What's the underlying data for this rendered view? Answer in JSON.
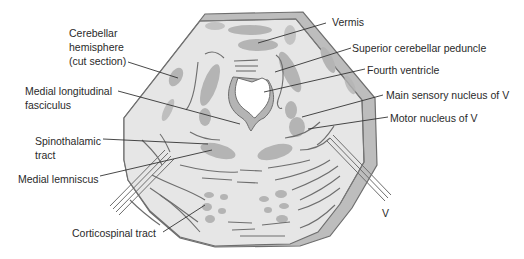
{
  "figure": {
    "colors": {
      "background": "#ffffff",
      "section_fill": "#e6e6e6",
      "rim_fill": "#bdbdbd",
      "outline": "#6e6e6e",
      "nucleus_fill": "#b4b4b4",
      "ventricle_fill": "#ffffff",
      "leader_line": "#333333",
      "label_text": "#2a2a2a"
    }
  },
  "labels": {
    "cerebellar_hemisphere": "Cerebellar\nhemisphere\n(cut section)",
    "medial_longitudinal_fasciculus": "Medial longitudinal\nfasciculus",
    "spinothalamic_tract": "Spinothalamic\ntract",
    "medial_lemniscus": "Medial lemniscus",
    "corticospinal_tract": "Corticospinal tract",
    "vermis": "Vermis",
    "superior_cerebellar_peduncle": "Superior cerebellar peduncle",
    "fourth_ventricle": "Fourth ventricle",
    "main_sensory_nucleus": "Main sensory nucleus of V",
    "motor_nucleus": "Motor nucleus of V",
    "trigeminal_nerve": "V"
  }
}
